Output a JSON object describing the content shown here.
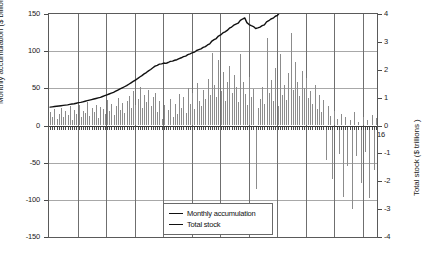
{
  "chart_data": {
    "type": "bar",
    "title": "",
    "subtitle": "",
    "xlabel": "",
    "ylabel": "Monthly accumulation ($ billions)",
    "y2label": "Total stock ($ trillions )",
    "ylim": [
      -150,
      150
    ],
    "y2lim": [
      -4,
      4
    ],
    "grid": true,
    "legend_position": "bottom-center",
    "y_ticks": [
      "150",
      "100",
      "50",
      "0",
      "-50",
      "-100",
      "-150"
    ],
    "y_tick_values": [
      150,
      100,
      50,
      0,
      -50,
      -100,
      -150
    ],
    "y2_ticks": [
      "4",
      "3",
      "2",
      "1",
      "0",
      "-1",
      "-2",
      "-3",
      "-4"
    ],
    "y2_tick_values": [
      4,
      3,
      2,
      1,
      0,
      -1,
      -2,
      -3,
      -4
    ],
    "x_ticks": [
      "2005",
      "2006",
      "2007",
      "2008",
      "2009",
      "2010",
      "2011",
      "2012",
      "2013",
      "2014",
      "2015",
      "2016"
    ],
    "x_start": 2005.0,
    "x_end": 2016.5,
    "series": [
      {
        "name": "Monthly accumulation",
        "type": "bar",
        "axis": "left",
        "units": "$ billions",
        "color": "#8c8c8c",
        "values": [
          18,
          12,
          22,
          9,
          16,
          24,
          11,
          19,
          14,
          26,
          8,
          21,
          15,
          28,
          12,
          20,
          17,
          31,
          13,
          23,
          18,
          27,
          10,
          25,
          22,
          16,
          34,
          19,
          29,
          14,
          26,
          37,
          21,
          30,
          17,
          33,
          40,
          24,
          46,
          28,
          35,
          52,
          23,
          41,
          31,
          48,
          26,
          38,
          44,
          18,
          33,
          9,
          27,
          -6,
          21,
          36,
          12,
          29,
          16,
          42,
          24,
          38,
          17,
          51,
          29,
          44,
          22,
          57,
          33,
          26,
          48,
          35,
          62,
          41,
          97,
          54,
          38,
          88,
          46,
          72,
          33,
          59,
          80,
          44,
          68,
          52,
          31,
          96,
          58,
          42,
          27,
          65,
          38,
          49,
          -86,
          24,
          36,
          52,
          29,
          118,
          44,
          61,
          33,
          78,
          26,
          96,
          41,
          55,
          34,
          70,
          125,
          48,
          86,
          58,
          40,
          73,
          51,
          64,
          37,
          46,
          29,
          55,
          22,
          41,
          18,
          34,
          -47,
          26,
          13,
          -72,
          20,
          9,
          -38,
          15,
          -96,
          11,
          -54,
          7,
          -112,
          18,
          -41,
          5,
          -78,
          12,
          -35,
          8,
          -98,
          14,
          -60,
          10
        ]
      },
      {
        "name": "Total stock",
        "type": "line",
        "axis": "right",
        "units": "$ trillions",
        "color": "#111111",
        "values": [
          0.66,
          0.67,
          0.68,
          0.69,
          0.7,
          0.71,
          0.72,
          0.73,
          0.74,
          0.76,
          0.77,
          0.78,
          0.8,
          0.82,
          0.83,
          0.85,
          0.87,
          0.89,
          0.91,
          0.93,
          0.95,
          0.97,
          0.99,
          1.01,
          1.04,
          1.07,
          1.1,
          1.13,
          1.16,
          1.19,
          1.23,
          1.27,
          1.31,
          1.35,
          1.39,
          1.43,
          1.48,
          1.53,
          1.58,
          1.63,
          1.68,
          1.74,
          1.79,
          1.85,
          1.9,
          1.96,
          2.01,
          2.07,
          2.13,
          2.16,
          2.2,
          2.21,
          2.24,
          2.23,
          2.26,
          2.3,
          2.31,
          2.34,
          2.36,
          2.4,
          2.43,
          2.47,
          2.49,
          2.54,
          2.57,
          2.61,
          2.63,
          2.69,
          2.72,
          2.75,
          2.8,
          2.83,
          2.89,
          2.93,
          3.03,
          3.08,
          3.12,
          3.21,
          3.25,
          3.32,
          3.36,
          3.41,
          3.49,
          3.53,
          3.6,
          3.64,
          3.67,
          3.77,
          3.82,
          3.86,
          3.69,
          3.62,
          3.58,
          3.55,
          3.48,
          3.5,
          3.53,
          3.58,
          3.61,
          3.72,
          3.76,
          3.82,
          3.85,
          3.92,
          3.95,
          4.05,
          4.09,
          4.14,
          4.17,
          4.24,
          4.36,
          4.41,
          4.49,
          4.55,
          4.59,
          4.66,
          4.71,
          4.77,
          4.81,
          4.85,
          4.88,
          4.93,
          4.95,
          4.99,
          5.01,
          5.04,
          4.99,
          4.97,
          4.95,
          4.88,
          4.86,
          4.85,
          4.81,
          4.8,
          4.7,
          4.69,
          4.63,
          4.63,
          4.52,
          4.53,
          4.49,
          4.49,
          4.41,
          4.42,
          4.39,
          4.39,
          4.29,
          4.31,
          4.25,
          4.26
        ]
      }
    ]
  },
  "legend": {
    "items": [
      {
        "label": "Monthly accumulation"
      },
      {
        "label": "Total stock"
      }
    ]
  }
}
